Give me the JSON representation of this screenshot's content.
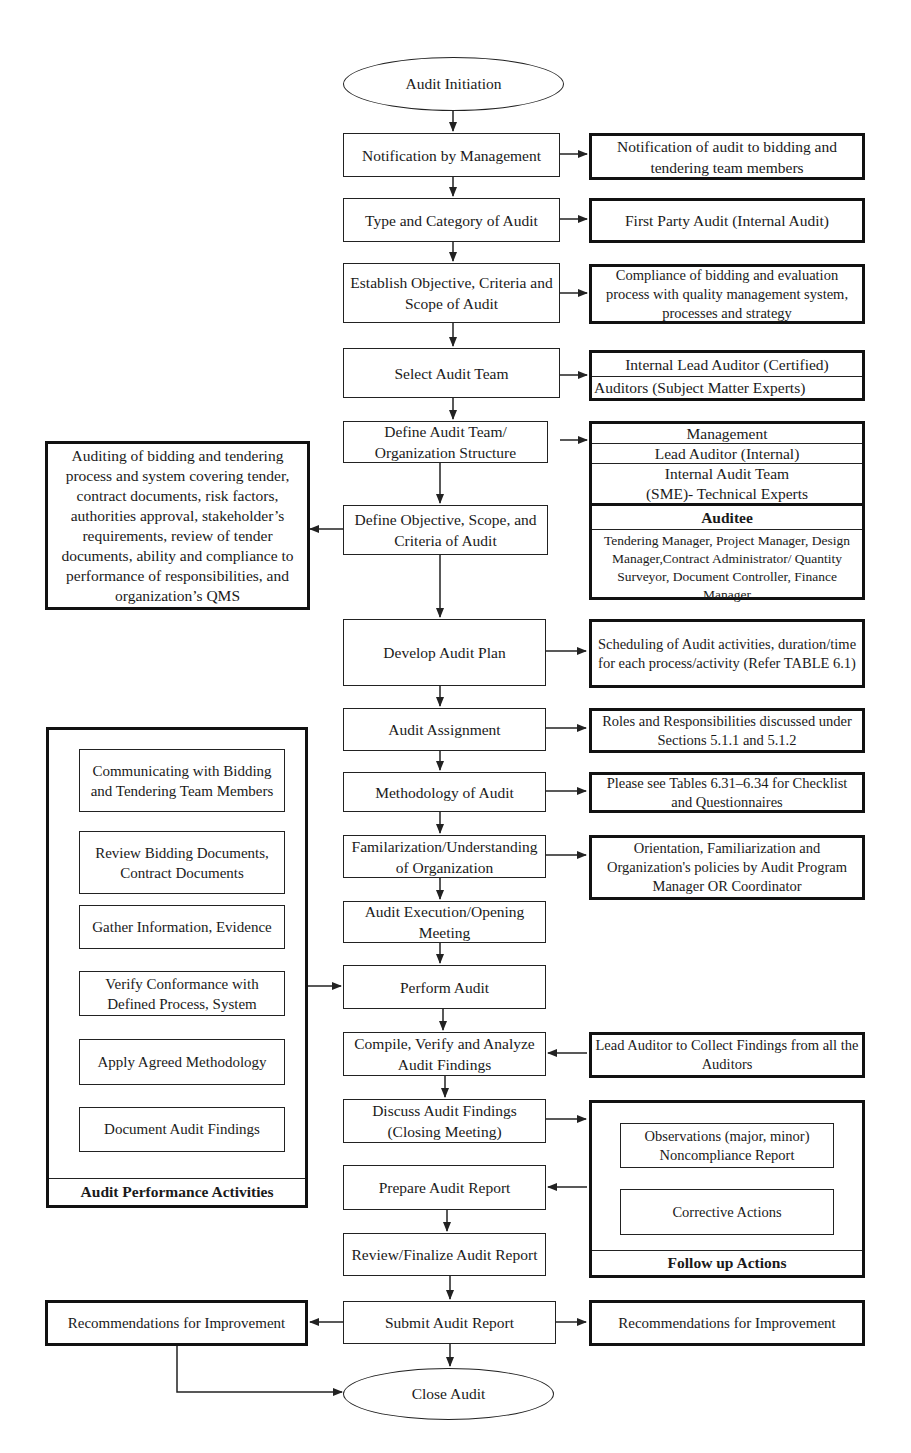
{
  "diagram": {
    "type": "flowchart",
    "start": "Audit Initiation",
    "end": "Close Audit",
    "main_flow": [
      "Notification by Management",
      "Type and Category of Audit",
      "Establish Objective, Criteria and Scope of Audit",
      "Select Audit Team",
      "Define Audit Team/ Organization Structure",
      "Define Objective, Scope, and Criteria of Audit",
      "Develop Audit Plan",
      "Audit Assignment",
      "Methodology of Audit",
      "Familarization/Understanding of Organization",
      "Audit Execution/Opening Meeting",
      "Perform Audit",
      "Compile, Verify and Analyze Audit Findings",
      "Discuss Audit Findings (Closing Meeting)",
      "Prepare Audit Report",
      "Review/Finalize Audit Report",
      "Submit Audit Report"
    ]
  },
  "nodes": {
    "audit_initiation": "Audit Initiation",
    "notification_by_management": "Notification by Management",
    "type_category": "Type and Category of Audit",
    "establish_objective": "Establish Objective, Criteria and Scope of Audit",
    "select_team": "Select Audit Team",
    "define_team": "Define Audit Team/ Organization Structure",
    "define_objective": "Define Objective, Scope, and Criteria of Audit",
    "develop_plan": "Develop Audit Plan",
    "audit_assignment": "Audit Assignment",
    "methodology": "Methodology of Audit",
    "familiarization": "Familarization/Understanding of Organization",
    "execution_opening": "Audit Execution/Opening Meeting",
    "perform_audit": "Perform Audit",
    "compile_findings": "Compile, Verify and Analyze Audit Findings",
    "discuss_findings": "Discuss Audit Findings (Closing Meeting)",
    "prepare_report": "Prepare Audit Report",
    "review_report": "Review/Finalize Audit Report",
    "submit_report": "Submit Audit Report",
    "close_audit": "Close Audit"
  },
  "side_notes": {
    "notification_detail": "Notification of audit to bidding and tendering team members",
    "audit_type": "First Party Audit (Internal Audit)",
    "compliance_scope": "Compliance of bidding and evaluation process with quality management system, processes and strategy",
    "team_lead": "Internal Lead Auditor (Certified)",
    "team_auditors": "Auditors (Subject Matter Experts)",
    "org_structure": {
      "management": "Management",
      "lead_auditor": "Lead Auditor (Internal)",
      "internal_team_line1": "Internal Audit Team",
      "internal_team_line2": "(SME)- Technical Experts",
      "auditee_title": "Auditee",
      "auditee_members": "Tendering Manager, Project Manager, Design Manager,Contract Administrator/ Quantity Surveyor, Document Controller, Finance Manager"
    },
    "audit_scope_detail": "Auditing of bidding and tendering process and system covering tender, contract documents, risk factors, authorities approval, stakeholder’s requirements, review of tender documents, ability and compliance to performance of responsibilities, and organization’s QMS",
    "plan_detail": "Scheduling of Audit activities, duration/time for each process/activity (Refer TABLE 6.1)",
    "assignment_detail": "Roles and Responsibilities discussed under Sections 5.1.1 and 5.1.2",
    "methodology_detail": "Please see Tables 6.31–6.34 for Checklist and Questionnaires",
    "familiarization_detail": "Orientation, Familiarization and Organization's policies by Audit Program Manager OR Coordinator",
    "lead_collect": "Lead Auditor to Collect Findings from all the Auditors",
    "recommendations_left": "Recommendations for Improvement",
    "recommendations_right": "Recommendations for Improvement"
  },
  "groups": {
    "performance": {
      "title": "Audit Performance Activities",
      "steps": [
        "Communicating with Bidding and Tendering Team Members",
        "Review Bidding Documents, Contract Documents",
        "Gather Information, Evidence",
        "Verify Conformance with Defined Process, System",
        "Apply Agreed Methodology",
        "Document Audit Findings"
      ]
    },
    "follow_up": {
      "title": "Follow up Actions",
      "items": [
        "Observations (major, minor) Noncompliance Report",
        "Corrective Actions"
      ]
    }
  },
  "colors": {
    "line": "#222222",
    "background": "#ffffff",
    "text": "#1a1a1a"
  }
}
